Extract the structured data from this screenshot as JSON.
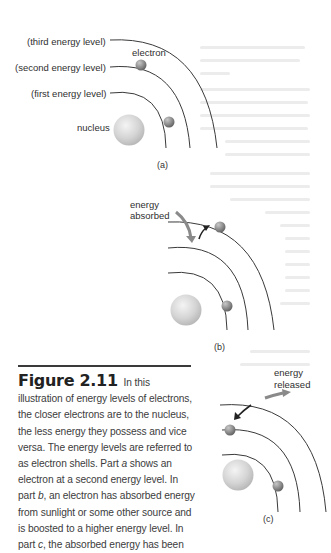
{
  "figure": {
    "number": "Figure 2.11",
    "caption_parts": [
      " In this illustration of energy levels of electrons, the closer electrons are to the nucleus, the less energy they possess and vice versa. The energy levels are referred to as electron shells. Part ",
      "a",
      " shows an electron at a second energy level. In part ",
      "b",
      ", an electron has absorbed energy from sunlight or some other source and is boosted to a higher energy level. In part ",
      "c",
      ", the absorbed energy has been"
    ]
  },
  "part_a": {
    "label": "(a)",
    "labels": {
      "third": "(third energy level)",
      "second": "(second energy level)",
      "first": "(first energy level)",
      "electron": "electron",
      "nucleus": "nucleus"
    }
  },
  "part_b": {
    "label": "(b)",
    "energy_label_1": "energy",
    "energy_label_2": "absorbed"
  },
  "part_c": {
    "label": "(c)",
    "energy_label_1": "energy",
    "energy_label_2": "released"
  },
  "colors": {
    "arc": "#3a3a3a",
    "arrow_gray": "#8a8a8a",
    "nucleus": "#d6d6d6",
    "electron": "#8c8c8c"
  }
}
